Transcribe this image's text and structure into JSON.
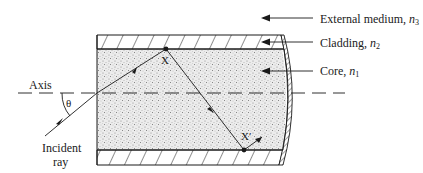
{
  "diagram": {
    "labels": {
      "external_medium": "External medium, ",
      "external_medium_n": "n",
      "external_medium_sub": "3",
      "cladding": "Cladding, ",
      "cladding_n": "n",
      "cladding_sub": "2",
      "core": "Core, ",
      "core_n": "n",
      "core_sub": "1",
      "axis": "Axis",
      "theta": "θ",
      "incident_ray_line1": "Incident",
      "incident_ray_line2": "ray",
      "reflection_point_1": "X",
      "reflection_point_2": "X′"
    },
    "colors": {
      "line": "#1a1a1a",
      "core_fill": "#e6e6e6",
      "background": "#ffffff"
    }
  }
}
